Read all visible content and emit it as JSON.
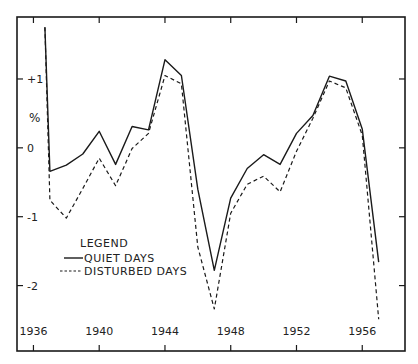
{
  "chart_data": {
    "type": "line",
    "title": "",
    "xlabel": "",
    "ylabel": "%",
    "xlim": [
      1935.0,
      1958.6
    ],
    "ylim": [
      -2.95,
      1.9
    ],
    "grid": false,
    "x_ticks": [
      1936,
      1940,
      1944,
      1948,
      1952,
      1956
    ],
    "x_tick_labels": [
      "1936",
      "1940",
      "1944",
      "1948",
      "1952",
      "1956"
    ],
    "y_ticks": [
      1,
      0,
      -1,
      -2
    ],
    "y_tick_labels": [
      "+1",
      "0",
      "-1",
      "-2"
    ],
    "legend": {
      "title": "LEGEND",
      "placement": "lower-left",
      "entries": [
        "QUIET DAYS",
        "DISTURBED DAYS"
      ]
    },
    "series": [
      {
        "name": "QUIET DAYS",
        "style": "solid",
        "x": [
          1936.7,
          1937,
          1938,
          1939,
          1940,
          1941,
          1942,
          1943,
          1944,
          1945,
          1946,
          1947,
          1948,
          1949,
          1950,
          1951,
          1952,
          1953,
          1954,
          1955,
          1956,
          1957
        ],
        "y": [
          1.75,
          -0.34,
          -0.25,
          -0.09,
          0.24,
          -0.24,
          0.31,
          0.26,
          1.28,
          1.05,
          -0.6,
          -1.78,
          -0.73,
          -0.3,
          -0.1,
          -0.24,
          0.21,
          0.47,
          1.04,
          0.97,
          0.27,
          -1.66
        ]
      },
      {
        "name": "DISTURBED DAYS",
        "style": "dashed",
        "x": [
          1936.7,
          1937,
          1938,
          1939,
          1940,
          1941,
          1942,
          1943,
          1944,
          1945,
          1946,
          1947,
          1948,
          1949,
          1950,
          1951,
          1952,
          1953,
          1954,
          1955,
          1956,
          1957
        ],
        "y": [
          1.75,
          -0.76,
          -1.02,
          -0.59,
          -0.15,
          -0.55,
          -0.01,
          0.21,
          1.05,
          0.93,
          -1.44,
          -2.34,
          -0.95,
          -0.53,
          -0.41,
          -0.64,
          -0.05,
          0.43,
          0.97,
          0.87,
          0.18,
          -2.49
        ]
      }
    ]
  }
}
